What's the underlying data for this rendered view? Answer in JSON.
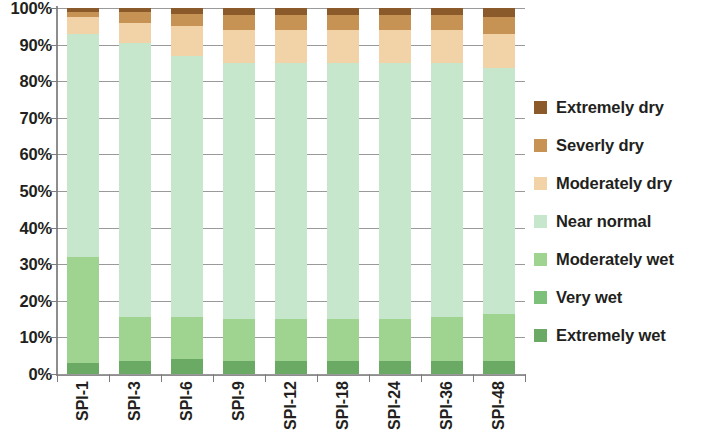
{
  "chart_data": {
    "type": "bar",
    "subtype": "stacked-percentage",
    "title": "",
    "xlabel": "",
    "ylabel": "",
    "ylim": [
      0,
      100
    ],
    "ytick_labels": [
      "100%",
      "90%",
      "80%",
      "70%",
      "60%",
      "50%",
      "40%",
      "30%",
      "20%",
      "10%",
      "0%"
    ],
    "ytick_values": [
      100,
      90,
      80,
      70,
      60,
      50,
      40,
      30,
      20,
      10,
      0
    ],
    "grid": true,
    "legend_position": "right",
    "categories": [
      "SPI-1",
      "SPI-3",
      "SPI-6",
      "SPI-9",
      "SPI-12",
      "SPI-18",
      "SPI-24",
      "SPI-36",
      "SPI-48"
    ],
    "stack_order_bottom_to_top": [
      "Extremely wet",
      "Very wet",
      "Moderately wet",
      "Near normal",
      "Moderately dry",
      "Severly dry",
      "Extremely dry"
    ],
    "series": [
      {
        "name": "Extremely wet",
        "color": "#6aaa64",
        "values": [
          3.0,
          3.5,
          4.0,
          3.5,
          3.5,
          3.5,
          3.5,
          3.5,
          3.5
        ]
      },
      {
        "name": "Very wet",
        "color": "#7cc07a",
        "values": [
          0.0,
          0.0,
          0.0,
          0.0,
          0.0,
          0.0,
          0.0,
          0.0,
          0.0
        ]
      },
      {
        "name": "Moderately wet",
        "color": "#9ed48f",
        "values": [
          29.0,
          12.0,
          11.5,
          11.5,
          11.5,
          11.5,
          11.5,
          12.0,
          13.0
        ]
      },
      {
        "name": "Near normal",
        "color": "#c7e7cc",
        "values": [
          61.0,
          75.0,
          71.5,
          70.0,
          70.0,
          70.0,
          70.0,
          69.5,
          67.0
        ]
      },
      {
        "name": "Moderately dry",
        "color": "#f2d3a8",
        "values": [
          4.5,
          5.5,
          8.0,
          9.0,
          9.0,
          9.0,
          9.0,
          9.0,
          9.5
        ]
      },
      {
        "name": "Severly dry",
        "color": "#c79354",
        "values": [
          1.5,
          3.0,
          3.5,
          4.0,
          4.0,
          4.0,
          4.0,
          4.0,
          4.5
        ]
      },
      {
        "name": "Extremely dry",
        "color": "#8a5a2b",
        "values": [
          1.0,
          1.0,
          1.5,
          2.0,
          2.0,
          2.0,
          2.0,
          2.0,
          2.5
        ]
      }
    ],
    "legend_entries": [
      {
        "label": "Extremely dry",
        "color": "#8a5a2b"
      },
      {
        "label": "Severly dry",
        "color": "#c79354"
      },
      {
        "label": "Moderately dry",
        "color": "#f2d3a8"
      },
      {
        "label": "Near normal",
        "color": "#c7e7cc"
      },
      {
        "label": "Moderately wet",
        "color": "#9ed48f"
      },
      {
        "label": "Very wet",
        "color": "#7cc07a"
      },
      {
        "label": "Extremely wet",
        "color": "#6aaa64"
      }
    ]
  }
}
